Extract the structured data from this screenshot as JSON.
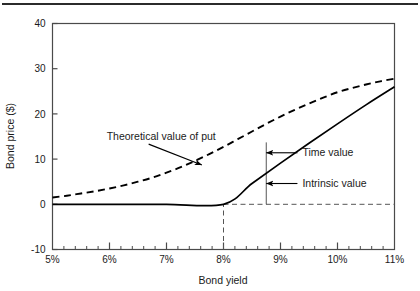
{
  "figure": {
    "top_rule": true
  },
  "chart_data": {
    "type": "line",
    "title": "",
    "subtitle": "",
    "xlabel": "Bond yield",
    "ylabel": "Bond price ($)",
    "xlim": [
      5,
      11
    ],
    "ylim": [
      -10,
      40
    ],
    "grid": false,
    "legend_position": "none",
    "x_tick_labels": [
      "5%",
      "6%",
      "7%",
      "8%",
      "9%",
      "10%",
      "11%"
    ],
    "x_tick_values": [
      5,
      6,
      7,
      8,
      9,
      10,
      11
    ],
    "x_minor_tick_step": 0.2,
    "y_tick_labels": [
      "40",
      "30",
      "20",
      "10",
      "0",
      "-10"
    ],
    "y_tick_values": [
      40,
      30,
      20,
      10,
      0,
      -10
    ],
    "series": [
      {
        "name": "Theoretical value of put",
        "style": "dashed",
        "x": [
          5.0,
          5.25,
          5.5,
          5.75,
          6.0,
          6.25,
          6.5,
          6.75,
          7.0,
          7.25,
          7.5,
          7.75,
          8.0,
          8.25,
          8.5,
          8.75,
          9.0,
          9.25,
          9.5,
          9.75,
          10.0,
          10.25,
          10.5,
          10.75,
          11.0
        ],
        "y": [
          1.5,
          1.9,
          2.4,
          2.9,
          3.5,
          4.2,
          5.0,
          5.9,
          7.0,
          8.2,
          9.6,
          11.1,
          12.7,
          14.4,
          16.1,
          17.8,
          19.4,
          20.9,
          22.3,
          23.6,
          24.8,
          25.7,
          26.5,
          27.2,
          27.8
        ]
      },
      {
        "name": "Intrinsic value",
        "style": "solid",
        "x": [
          5.0,
          6.0,
          7.0,
          8.0,
          8.5,
          9.0,
          9.5,
          10.0,
          10.5,
          11.0
        ],
        "y": [
          0,
          0,
          0,
          0,
          4.6,
          9.1,
          13.5,
          17.8,
          22.0,
          26.0
        ]
      }
    ],
    "reference_lines": [
      {
        "name": "zero-level-dashed",
        "type": "horizontal",
        "y": 0,
        "x_from": 8.0,
        "x_to": 11.0,
        "style": "dashed"
      },
      {
        "name": "strike-vertical-dashed",
        "type": "vertical",
        "x": 8.0,
        "y_from": -10,
        "y_to": 0,
        "style": "dashed"
      },
      {
        "name": "value-split-vertical",
        "type": "vertical",
        "x": 8.75,
        "y_from": 0,
        "y_to": 13.7,
        "style": "solid"
      }
    ],
    "annotations": [
      {
        "name": "theoretical-value-of-put",
        "text": "Theoretical value of put",
        "point_x": 7.62,
        "point_y": 8.7,
        "label_x": 5.95,
        "label_y": 14.2
      },
      {
        "name": "time-value",
        "text": "Time value",
        "point_x": 8.75,
        "point_y": 11.4,
        "label_x": 9.35,
        "label_y": 11.4
      },
      {
        "name": "intrinsic-value",
        "text": "Intrinsic value",
        "point_x": 8.75,
        "point_y": 4.6,
        "label_x": 9.35,
        "label_y": 4.6
      }
    ]
  }
}
